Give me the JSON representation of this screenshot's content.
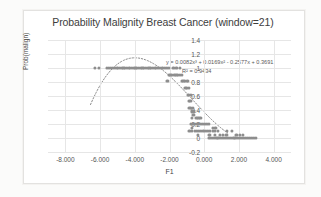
{
  "chart_data": {
    "type": "scatter",
    "title": "Probability Malignity Breast Cancer (window=21)",
    "xlabel": "F1",
    "ylabel": "Prob(malign)",
    "xlim": [
      -9.0,
      5.0
    ],
    "ylim": [
      -0.2,
      1.4
    ],
    "xticks": [
      "-8.000",
      "-6.000",
      "-4.000",
      "-2.000",
      "0.000",
      "2.000",
      "4.000"
    ],
    "xtick_values": [
      -8,
      -6,
      -4,
      -2,
      0,
      2,
      4
    ],
    "yticks": [
      "-0.2",
      "0",
      "0.2",
      "0.4",
      "0.6",
      "0.8",
      "1",
      "1.2",
      "1.4"
    ],
    "ytick_values": [
      -0.2,
      0,
      0.2,
      0.4,
      0.6,
      0.8,
      1,
      1.2,
      1.4
    ],
    "grid": true,
    "legend": "none",
    "marker_color": "#8d8d8d",
    "trendline": {
      "type": "polynomial-cubic",
      "style": "dotted",
      "color": "#8a8a8a",
      "equation": "y = 0.0082x³ + 0.0169x² - 0.2577x + 0.3691",
      "r_squared": "R² = 0.9434",
      "coefficients": [
        0.0082,
        0.0169,
        -0.2577,
        0.3691
      ],
      "x_start": -6.55,
      "x_end": 1.35
    },
    "series": [
      {
        "name": "Prob(malign)",
        "points": [
          [
            -6.3,
            1.0
          ],
          [
            -6.05,
            1.0
          ],
          [
            -5.62,
            1.0
          ],
          [
            -5.47,
            1.0
          ],
          [
            -5.36,
            1.0
          ],
          [
            -5.26,
            1.0
          ],
          [
            -5.16,
            1.0
          ],
          [
            -5.05,
            1.0
          ],
          [
            -4.95,
            1.0
          ],
          [
            -4.86,
            1.0
          ],
          [
            -4.76,
            1.0
          ],
          [
            -4.66,
            1.0
          ],
          [
            -4.56,
            1.0
          ],
          [
            -4.46,
            1.0
          ],
          [
            -4.36,
            1.0
          ],
          [
            -4.26,
            1.0
          ],
          [
            -4.16,
            1.0
          ],
          [
            -4.06,
            1.0
          ],
          [
            -3.96,
            1.0
          ],
          [
            -3.86,
            1.0
          ],
          [
            -3.76,
            1.0
          ],
          [
            -3.66,
            1.0
          ],
          [
            -3.56,
            1.0
          ],
          [
            -3.46,
            1.0
          ],
          [
            -3.36,
            1.0
          ],
          [
            -3.26,
            1.0
          ],
          [
            -3.16,
            1.0
          ],
          [
            -3.06,
            1.0
          ],
          [
            -2.96,
            1.0
          ],
          [
            -2.86,
            1.0
          ],
          [
            -2.76,
            1.0
          ],
          [
            -2.66,
            1.0
          ],
          [
            -2.56,
            1.0
          ],
          [
            -2.46,
            1.0
          ],
          [
            -2.36,
            1.0
          ],
          [
            -2.26,
            1.0
          ],
          [
            -2.16,
            1.0
          ],
          [
            -2.02,
            1.0
          ],
          [
            -1.78,
            1.0
          ],
          [
            -1.6,
            1.0
          ],
          [
            -1.4,
            1.0
          ],
          [
            -2.05,
            0.905
          ],
          [
            -1.95,
            0.905
          ],
          [
            -1.85,
            0.905
          ],
          [
            -1.72,
            0.905
          ],
          [
            -1.6,
            0.905
          ],
          [
            -1.5,
            0.905
          ],
          [
            -1.4,
            0.905
          ],
          [
            -1.28,
            0.905
          ],
          [
            -2.12,
            0.81
          ],
          [
            -1.3,
            0.81
          ],
          [
            -1.2,
            0.81
          ],
          [
            -1.1,
            0.81
          ],
          [
            -1.0,
            0.81
          ],
          [
            -0.92,
            0.81
          ],
          [
            -1.08,
            0.715
          ],
          [
            -0.98,
            0.715
          ],
          [
            -0.9,
            0.715
          ],
          [
            -0.95,
            0.62
          ],
          [
            -0.86,
            0.62
          ],
          [
            -0.78,
            0.62
          ],
          [
            -0.9,
            0.525
          ],
          [
            -0.8,
            0.525
          ],
          [
            -0.85,
            0.43
          ],
          [
            -0.76,
            0.43
          ],
          [
            -0.66,
            0.43
          ],
          [
            -0.7,
            0.38
          ],
          [
            -0.6,
            0.38
          ],
          [
            -0.62,
            0.33
          ],
          [
            -0.7,
            0.285
          ],
          [
            -0.45,
            0.285
          ],
          [
            -0.33,
            0.285
          ],
          [
            -0.22,
            0.285
          ],
          [
            -0.78,
            0.2
          ],
          [
            -0.66,
            0.2
          ],
          [
            -0.55,
            0.2
          ],
          [
            -0.44,
            0.2
          ],
          [
            -0.32,
            0.2
          ],
          [
            -0.2,
            0.2
          ],
          [
            -0.08,
            0.2
          ],
          [
            0.04,
            0.2
          ],
          [
            0.16,
            0.2
          ],
          [
            0.28,
            0.2
          ],
          [
            -0.7,
            0.145
          ],
          [
            0.52,
            0.145
          ],
          [
            0.64,
            0.145
          ],
          [
            -0.85,
            0.1
          ],
          [
            -0.7,
            0.1
          ],
          [
            -0.55,
            0.1
          ],
          [
            -0.42,
            0.1
          ],
          [
            -0.3,
            0.1
          ],
          [
            -0.18,
            0.1
          ],
          [
            -0.05,
            0.1
          ],
          [
            0.08,
            0.1
          ],
          [
            0.22,
            0.1
          ],
          [
            0.35,
            0.1
          ],
          [
            0.5,
            0.1
          ],
          [
            0.62,
            0.1
          ],
          [
            0.78,
            0.1
          ],
          [
            1.3,
            0.1
          ],
          [
            1.6,
            0.1
          ],
          [
            -0.38,
            0.05
          ],
          [
            0.3,
            0.05
          ],
          [
            0.62,
            0.05
          ],
          [
            0.9,
            0.05
          ],
          [
            1.1,
            0.05
          ],
          [
            1.28,
            0.05
          ],
          [
            0.3,
            0.005
          ],
          [
            0.45,
            0.005
          ],
          [
            0.58,
            0.005
          ],
          [
            0.7,
            0.005
          ],
          [
            0.82,
            0.005
          ],
          [
            0.95,
            0.005
          ],
          [
            1.08,
            0.005
          ],
          [
            1.2,
            0.005
          ],
          [
            1.32,
            0.005
          ],
          [
            1.44,
            0.005
          ],
          [
            1.56,
            0.005
          ],
          [
            1.68,
            0.005
          ],
          [
            1.8,
            0.005
          ],
          [
            1.92,
            0.005
          ],
          [
            2.04,
            0.005
          ],
          [
            2.16,
            0.005
          ],
          [
            2.28,
            0.005
          ],
          [
            2.4,
            0.005
          ],
          [
            2.52,
            0.005
          ],
          [
            2.64,
            0.005
          ],
          [
            2.76,
            0.005
          ],
          [
            2.88,
            0.005
          ],
          [
            2.98,
            0.005
          ],
          [
            1.85,
            0.05
          ],
          [
            2.05,
            0.05
          ],
          [
            2.25,
            0.05
          ]
        ]
      }
    ]
  }
}
